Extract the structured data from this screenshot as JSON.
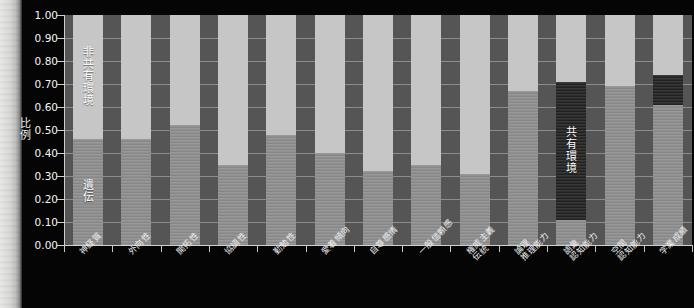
{
  "chart_data": {
    "type": "bar",
    "subtype": "stacked-bar-100-percent",
    "title": "",
    "xlabel": "",
    "ylabel": "比例",
    "ylim": [
      0.0,
      1.0
    ],
    "ytick_labels": [
      "1.00",
      "0.90",
      "0.80",
      "0.70",
      "0.60",
      "0.50",
      "0.40",
      "0.30",
      "0.20",
      "0.10",
      "0.00"
    ],
    "ytick_values": [
      1.0,
      0.9,
      0.8,
      0.7,
      0.6,
      0.5,
      0.4,
      0.3,
      0.2,
      0.1,
      0.0
    ],
    "grid": true,
    "legend_position": "in-plot-annotations",
    "categories": [
      "神経質",
      "外向性",
      "開拓性",
      "協調性",
      "勤勉性",
      "愛着傾向",
      "自尊感情",
      "一般信頼感",
      "権威主義\n伝統",
      "論理\n推理能力",
      "語彙\n認知能力",
      "空間\n認知能力",
      "学業成績"
    ],
    "series": [
      {
        "name": "遺伝",
        "color": "#8d8d8d",
        "values": [
          0.46,
          0.46,
          0.52,
          0.35,
          0.48,
          0.4,
          0.32,
          0.35,
          0.31,
          0.67,
          0.11,
          0.69,
          0.61
        ]
      },
      {
        "name": "共有環境",
        "color": "#2b2b2b",
        "values": [
          0.0,
          0.0,
          0.0,
          0.0,
          0.0,
          0.0,
          0.0,
          0.0,
          0.0,
          0.0,
          0.6,
          0.0,
          0.13
        ]
      },
      {
        "name": "非共有環境",
        "color": "#c6c6c6",
        "values": [
          0.54,
          0.54,
          0.48,
          0.65,
          0.52,
          0.6,
          0.68,
          0.65,
          0.69,
          0.33,
          0.29,
          0.31,
          0.26
        ]
      }
    ],
    "annotations": [
      {
        "text": "非共有環境",
        "bar_index": 0,
        "segment": "非共有環境"
      },
      {
        "text": "遺伝",
        "bar_index": 0,
        "segment": "遺伝"
      },
      {
        "text": "共有環境",
        "bar_index": 10,
        "segment": "共有環境"
      }
    ]
  },
  "axis": {
    "y_label_chars": [
      "比",
      "例"
    ]
  }
}
